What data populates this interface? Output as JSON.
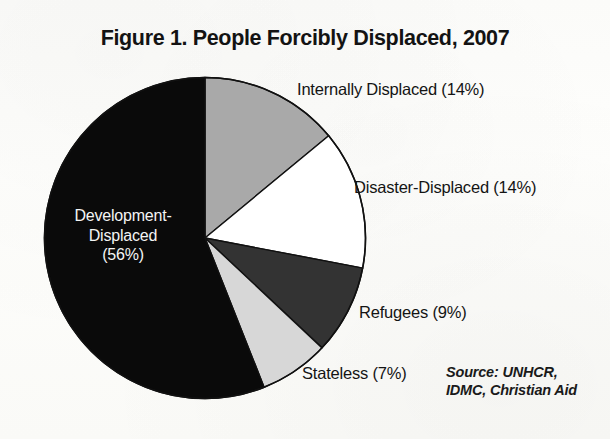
{
  "chart_data": {
    "type": "pie",
    "title": "Figure 1. People Forcibly Displaced, 2007",
    "xlabel": "",
    "ylabel": "",
    "legend_position": "callout-labels",
    "grid": false,
    "start_angle_deg": 0,
    "direction": "clockwise",
    "categories": [
      "Internally Displaced",
      "Disaster-Displaced",
      "Refugees",
      "Stateless",
      "Development-Displaced"
    ],
    "values": [
      14,
      14,
      9,
      7,
      56
    ],
    "value_unit": "%",
    "slices": [
      {
        "name": "Internally Displaced",
        "value": 14,
        "label": "Internally Displaced (14%)",
        "color": "#a9a9a9",
        "text_color": "#141414",
        "label_placement": "outside-right-top"
      },
      {
        "name": "Disaster-Displaced",
        "value": 14,
        "label": "Disaster-Displaced (14%)",
        "color": "#ffffff",
        "text_color": "#141414",
        "label_placement": "outside-right"
      },
      {
        "name": "Refugees",
        "value": 9,
        "label": "Refugees (9%)",
        "color": "#333333",
        "text_color": "#141414",
        "label_placement": "outside-right-bottom"
      },
      {
        "name": "Stateless",
        "value": 7,
        "label": "Stateless (7%)",
        "color": "#d7d7d7",
        "text_color": "#141414",
        "label_placement": "outside-bottom"
      },
      {
        "name": "Development-Displaced",
        "value": 56,
        "label": "Development-Displaced (56%)",
        "color": "#0a0a0a",
        "text_color": "#f4f4f4",
        "label_placement": "inside"
      }
    ],
    "annotations": [
      "Source: UNHCR,",
      "IDMC, Christian Aid"
    ]
  },
  "labels": {
    "internally_displaced": "Internally Displaced (14%)",
    "disaster_displaced": "Disaster-Displaced (14%)",
    "refugees": "Refugees (9%)",
    "stateless": "Stateless (7%)",
    "development_displaced_line1": "Development-",
    "development_displaced_line2": "Displaced",
    "development_displaced_line3": "(56%)"
  },
  "source": {
    "line1": "Source: UNHCR,",
    "line2": "IDMC, Christian Aid"
  },
  "colors": {
    "background": "#fdfdfb",
    "ink": "#141414",
    "slice_internally_displaced": "#a9a9a9",
    "slice_disaster_displaced": "#ffffff",
    "slice_refugees": "#333333",
    "slice_stateless": "#d7d7d7",
    "slice_development_displaced": "#0a0a0a",
    "outline": "#111111"
  }
}
